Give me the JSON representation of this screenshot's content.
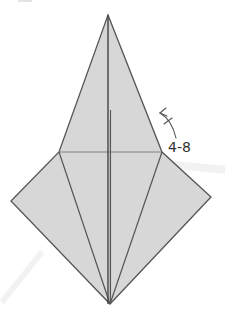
{
  "diagram": {
    "type": "origami-fold-diagram",
    "annotation": {
      "label": "4-8",
      "arrow": "valley-fold-arrow"
    },
    "colors": {
      "paper_fill": "#d7d7d7",
      "line": "#555555",
      "center_line": "#444444",
      "watermark": "#f1f1f1",
      "background": "#ffffff"
    },
    "shape": {
      "apex": [
        108,
        15
      ],
      "left_vertex": [
        59,
        152
      ],
      "right_vertex": [
        162,
        152
      ],
      "left_point": [
        11,
        201
      ],
      "right_point": [
        211,
        197
      ],
      "bottom_point": [
        110,
        304
      ]
    }
  }
}
